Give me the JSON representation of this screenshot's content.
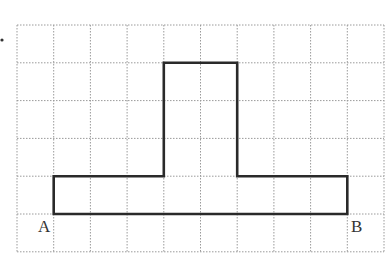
{
  "figure": {
    "type": "grid-polygon",
    "grid": {
      "columns": 10,
      "rows": 6,
      "origin_px": [
        17,
        25
      ],
      "cell_w_px": 36.7,
      "cell_h_px": 37.8,
      "line_color": "#9a9a9a",
      "style": "dotted"
    },
    "shape": {
      "stroke_color": "#2a2a2a",
      "stroke_width": 2.6,
      "vertices_grid": [
        [
          1,
          5
        ],
        [
          1,
          4
        ],
        [
          4,
          4
        ],
        [
          4,
          1
        ],
        [
          6,
          1
        ],
        [
          6,
          4
        ],
        [
          9,
          4
        ],
        [
          9,
          5
        ]
      ]
    },
    "labels": {
      "A": "A",
      "B": "B"
    },
    "marker": "•"
  }
}
